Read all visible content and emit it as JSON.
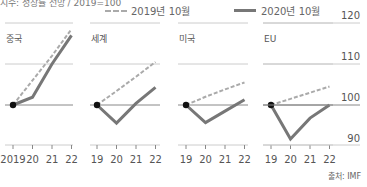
{
  "header": {
    "subtitle": "지수: 성장률 전망 / 2019=100",
    "legend": [
      {
        "label": "2019년 10월",
        "style": "dashed",
        "color": "#aaaaaa"
      },
      {
        "label": "2020년 10월",
        "style": "solid",
        "color": "#777777"
      }
    ]
  },
  "source": "출처: IMF",
  "colors": {
    "dashed": "#aaaaaa",
    "solid": "#777777",
    "grid": "#cccccc",
    "baseline": "#888888",
    "dot": "#111111"
  },
  "chart_data": {
    "type": "line",
    "title": "",
    "subtitle": "지수: 성장률 전망 / 2019=100",
    "ylabel": "2019=100",
    "ylim": [
      90,
      120
    ],
    "yticks": [
      90,
      100,
      110,
      120
    ],
    "grid": true,
    "legend_position": "top",
    "legend": [
      "2019년 10월",
      "2020년 10월"
    ],
    "panels": [
      {
        "name": "중국",
        "x": [
          "2019",
          "20",
          "21",
          "22"
        ],
        "series": [
          {
            "name": "2019년 10월",
            "values": [
              100,
              106,
              112,
              118.5
            ]
          },
          {
            "name": "2020년 10월",
            "values": [
              100,
              101.9,
              110,
              117
            ]
          }
        ]
      },
      {
        "name": "세계",
        "x": [
          "19",
          "20",
          "21",
          "22"
        ],
        "series": [
          {
            "name": "2019년 10월",
            "values": [
              100,
              103.4,
              106.9,
              110.5
            ]
          },
          {
            "name": "2020년 10월",
            "values": [
              100,
              95.6,
              100.4,
              104.3
            ]
          }
        ]
      },
      {
        "name": "미국",
        "x": [
          "19",
          "20",
          "21",
          "22"
        ],
        "series": [
          {
            "name": "2019년 10월",
            "values": [
              100,
              102,
              103.8,
              105.5
            ]
          },
          {
            "name": "2020년 10월",
            "values": [
              100,
              95.7,
              98.5,
              101.3
            ]
          }
        ]
      },
      {
        "name": "EU",
        "x": [
          "19",
          "20",
          "21",
          "22"
        ],
        "series": [
          {
            "name": "2019년 10월",
            "values": [
              100,
              101.5,
              103,
              104.5
            ]
          },
          {
            "name": "2020년 10월",
            "values": [
              100,
              91.7,
              96.8,
              100
            ]
          }
        ]
      }
    ]
  }
}
